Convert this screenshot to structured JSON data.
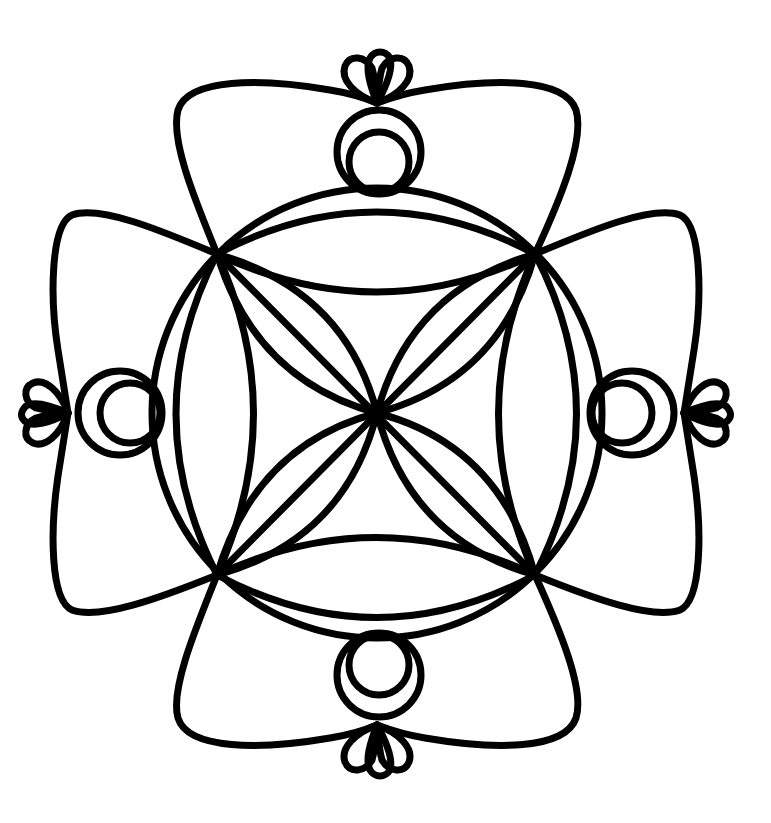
{
  "artwork": {
    "type": "coloring-page-mandala",
    "background_color": "#ffffff",
    "line_color": "#000000",
    "stroke_width": 7,
    "center": [
      377,
      413
    ],
    "ornaments": [
      {
        "position": "top",
        "name": "top-ornament"
      },
      {
        "position": "bottom",
        "name": "bottom-ornament"
      },
      {
        "position": "left",
        "name": "left-ornament"
      },
      {
        "position": "right",
        "name": "right-ornament"
      }
    ]
  }
}
